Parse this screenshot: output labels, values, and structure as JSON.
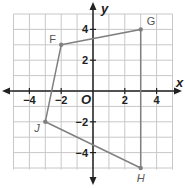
{
  "diagram": {
    "type": "coordinate-plane-polygon",
    "axes": {
      "x_label": "x",
      "y_label": "y",
      "origin_label": "O"
    },
    "x_ticks": [
      "−4",
      "−2",
      "2",
      "4"
    ],
    "y_ticks": [
      "4",
      "2",
      "−2",
      "−4"
    ],
    "points": [
      {
        "name": "F",
        "x": -2,
        "y": 3
      },
      {
        "name": "G",
        "x": 3,
        "y": 4
      },
      {
        "name": "H",
        "x": 3,
        "y": -5
      },
      {
        "name": "J",
        "x": -3,
        "y": -2
      }
    ],
    "colors": {
      "grid": "#c8c8c8",
      "axis": "#222222",
      "polygon": "#808080"
    }
  }
}
